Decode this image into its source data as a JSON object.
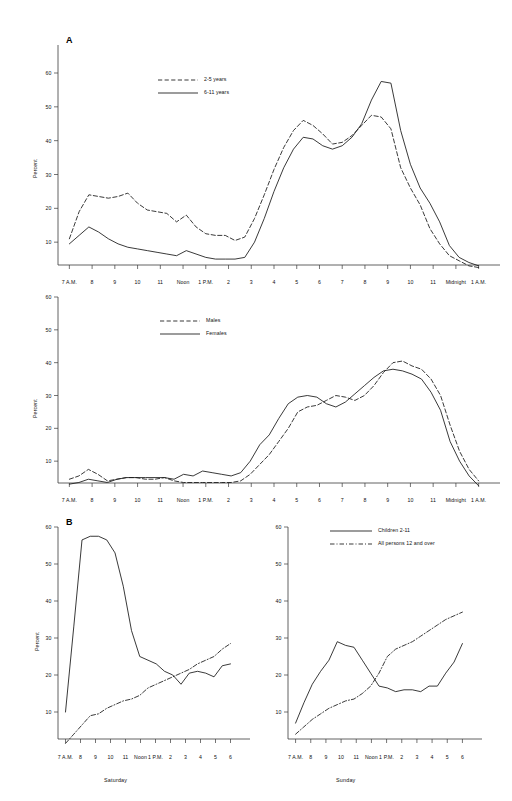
{
  "figure": {
    "panel_a_label": "A",
    "panel_b_label": "B",
    "axis_y_title": "Percent"
  },
  "chart_data": [
    {
      "id": "panel-a-age",
      "type": "line",
      "title": "",
      "panel": "A",
      "xlabel": "",
      "ylabel": "Percent",
      "ylim": [
        0,
        60
      ],
      "yticks": [
        10,
        20,
        30,
        40,
        50,
        60
      ],
      "grid": false,
      "legend_position": "upper-left-inside",
      "x": [
        "7 A.M.",
        "8",
        "9",
        "10",
        "11",
        "Noon",
        "1 P.M.",
        "2",
        "3",
        "4",
        "5",
        "6",
        "7",
        "8",
        "9",
        "10",
        "11",
        "Midnight",
        "1 A.M."
      ],
      "categories": [
        "7 A.M.",
        "8",
        "9",
        "10",
        "11",
        "Noon",
        "1 P.M.",
        "2",
        "3",
        "4",
        "5",
        "6",
        "7",
        "8",
        "9",
        "10",
        "11",
        "Midnight",
        "1 A.M."
      ],
      "series": [
        {
          "name": "2-5 years",
          "style": "dashed",
          "values_half_hourly": [
            11.0,
            19.0,
            24.0,
            23.5,
            23.0,
            23.5,
            24.5,
            21.5,
            19.5,
            19.0,
            18.5,
            16.0,
            18.0,
            14.5,
            12.5,
            12.0,
            12.0,
            10.5,
            11.5,
            17.0,
            24.0,
            31.5,
            38.0,
            43.0,
            46.0,
            44.5,
            42.0,
            39.0,
            39.5,
            41.5,
            44.5,
            47.5,
            47.0,
            43.5,
            32.0,
            26.0,
            21.0,
            14.0,
            9.5,
            6.0,
            4.5,
            3.0,
            2.5
          ],
          "values": [
            11.0,
            24.0,
            23.0,
            19.5,
            18.5,
            12.5,
            12.0,
            10.5,
            17.0,
            31.5,
            46.0,
            39.0,
            41.5,
            47.5,
            43.5,
            21.0,
            9.5,
            4.5,
            2.5
          ]
        },
        {
          "name": "6-11 years",
          "style": "solid",
          "values_half_hourly": [
            9.5,
            12.0,
            14.5,
            13.0,
            11.0,
            9.5,
            8.5,
            8.0,
            7.5,
            7.0,
            6.5,
            6.0,
            7.5,
            6.5,
            5.5,
            5.0,
            5.0,
            5.0,
            5.5,
            10.0,
            17.0,
            25.0,
            32.0,
            37.5,
            41.0,
            40.5,
            38.5,
            37.5,
            38.5,
            41.0,
            45.0,
            52.0,
            57.5,
            57.0,
            43.0,
            33.0,
            26.0,
            21.5,
            16.0,
            9.0,
            5.5,
            4.0,
            3.0
          ],
          "values": [
            9.5,
            14.5,
            11.0,
            8.5,
            7.5,
            6.5,
            7.5,
            5.5,
            5.0,
            10.0,
            25.0,
            41.0,
            38.5,
            41.0,
            57.5,
            43.0,
            26.0,
            9.0,
            3.0
          ]
        }
      ]
    },
    {
      "id": "panel-a-sex",
      "type": "line",
      "title": "",
      "panel": "A",
      "xlabel": "",
      "ylabel": "Percent",
      "ylim": [
        0,
        60
      ],
      "yticks": [
        10,
        20,
        30,
        40,
        50,
        60
      ],
      "grid": false,
      "legend_position": "upper-left-inside",
      "x": [
        "7 A.M.",
        "8",
        "9",
        "10",
        "11",
        "Noon",
        "1 P.M.",
        "2",
        "3",
        "4",
        "5",
        "6",
        "7",
        "8",
        "9",
        "10",
        "11",
        "Midnight",
        "1 A.M."
      ],
      "categories": [
        "7 A.M.",
        "8",
        "9",
        "10",
        "11",
        "Noon",
        "1 P.M.",
        "2",
        "3",
        "4",
        "5",
        "6",
        "7",
        "8",
        "9",
        "10",
        "11",
        "Midnight",
        "1 A.M."
      ],
      "series": [
        {
          "name": "Males",
          "style": "dashed",
          "values_half_hourly": [
            4.5,
            5.5,
            7.5,
            6.0,
            4.0,
            4.5,
            5.0,
            5.0,
            4.5,
            4.5,
            5.0,
            4.0,
            3.5,
            3.5,
            3.5,
            3.5,
            3.5,
            3.5,
            4.0,
            6.0,
            9.0,
            12.0,
            16.0,
            20.0,
            25.0,
            26.5,
            27.0,
            28.5,
            30.0,
            29.5,
            28.5,
            30.0,
            33.0,
            37.0,
            40.0,
            40.5,
            39.0,
            38.0,
            35.0,
            30.0,
            21.0,
            13.0,
            7.5,
            4.0
          ],
          "values": [
            4.5,
            7.5,
            4.0,
            5.0,
            5.0,
            3.5,
            3.5,
            3.5,
            6.0,
            12.0,
            25.0,
            27.0,
            30.0,
            30.0,
            40.0,
            39.0,
            35.0,
            21.0,
            4.0
          ]
        },
        {
          "name": "Females",
          "style": "solid",
          "values_half_hourly": [
            3.0,
            3.5,
            4.5,
            4.0,
            3.5,
            4.5,
            5.0,
            5.0,
            5.0,
            5.0,
            5.0,
            4.5,
            6.0,
            5.5,
            7.0,
            6.5,
            6.0,
            5.5,
            6.5,
            10.0,
            15.0,
            18.0,
            23.0,
            27.5,
            29.5,
            30.0,
            29.5,
            27.5,
            26.5,
            28.0,
            30.5,
            33.0,
            35.5,
            37.5,
            38.0,
            37.5,
            36.5,
            35.0,
            31.0,
            25.5,
            16.0,
            10.0,
            5.5,
            2.5
          ],
          "values": [
            3.0,
            4.5,
            3.5,
            5.0,
            5.0,
            6.0,
            7.0,
            6.0,
            10.0,
            18.0,
            29.5,
            29.5,
            26.5,
            33.0,
            38.0,
            36.5,
            31.0,
            16.0,
            2.5
          ]
        }
      ]
    },
    {
      "id": "panel-b-saturday",
      "type": "line",
      "title": "",
      "panel": "B",
      "xlabel": "Saturday",
      "ylabel": "Percent",
      "ylim": [
        0,
        60
      ],
      "yticks": [
        10,
        20,
        30,
        40,
        50,
        60
      ],
      "grid": false,
      "legend_position": "none",
      "x": [
        "7 A.M.",
        "8",
        "9",
        "10",
        "11",
        "Noon",
        "1 P.M.",
        "2",
        "3",
        "4",
        "5",
        "6"
      ],
      "categories": [
        "7 A.M.",
        "8",
        "9",
        "10",
        "11",
        "Noon",
        "1 P.M.",
        "2",
        "3",
        "4",
        "5",
        "6"
      ],
      "series": [
        {
          "name": "Children 2-11",
          "style": "solid",
          "values_half_hourly": [
            10.0,
            33.0,
            56.5,
            57.5,
            57.5,
            56.5,
            53.0,
            44.0,
            32.0,
            25.0,
            24.0,
            23.0,
            21.0,
            20.0,
            17.5,
            20.5,
            21.0,
            20.5,
            19.5,
            22.5,
            23.0
          ],
          "values": [
            10.0,
            56.5,
            57.5,
            53.0,
            32.0,
            24.0,
            21.0,
            17.5,
            21.0,
            19.5,
            23.0
          ]
        },
        {
          "name": "All persons 12 and over",
          "style": "dashdot",
          "values_half_hourly": [
            1.5,
            4.0,
            6.5,
            9.0,
            9.5,
            11.0,
            12.0,
            13.0,
            13.5,
            14.5,
            16.5,
            17.5,
            18.5,
            19.5,
            20.5,
            21.5,
            23.0,
            24.0,
            25.0,
            27.0,
            28.5
          ],
          "values": [
            1.5,
            6.5,
            9.5,
            12.0,
            13.5,
            16.5,
            18.5,
            20.5,
            23.0,
            25.0,
            28.5
          ]
        }
      ]
    },
    {
      "id": "panel-b-sunday",
      "type": "line",
      "title": "",
      "panel": "B",
      "xlabel": "Sunday",
      "ylabel": "",
      "ylim": [
        0,
        60
      ],
      "yticks": [
        10,
        20,
        30,
        40,
        50,
        60
      ],
      "grid": false,
      "legend_position": "top-center",
      "x": [
        "7 A.M.",
        "8",
        "9",
        "10",
        "11",
        "Noon",
        "1 P.M.",
        "2",
        "3",
        "4",
        "5",
        "6"
      ],
      "categories": [
        "7 A.M.",
        "8",
        "9",
        "10",
        "11",
        "Noon",
        "1 P.M.",
        "2",
        "3",
        "4",
        "5",
        "6"
      ],
      "series": [
        {
          "name": "Children 2-11",
          "style": "solid",
          "values_half_hourly": [
            7.0,
            12.5,
            17.5,
            21.0,
            24.0,
            29.0,
            28.0,
            27.5,
            24.0,
            20.5,
            17.0,
            16.5,
            15.5,
            16.0,
            16.0,
            15.5,
            17.0,
            17.0,
            20.5,
            23.5,
            28.5
          ],
          "values": [
            7.0,
            17.5,
            24.0,
            28.0,
            24.0,
            17.0,
            15.5,
            16.0,
            17.0,
            20.5,
            28.5
          ]
        },
        {
          "name": "All persons 12 and over",
          "style": "dashdot",
          "values_half_hourly": [
            4.0,
            6.0,
            8.0,
            9.5,
            11.0,
            12.0,
            13.0,
            13.5,
            15.0,
            17.0,
            20.5,
            25.0,
            27.0,
            28.0,
            29.0,
            30.5,
            32.0,
            33.5,
            35.0,
            36.0,
            37.0
          ],
          "values": [
            4.0,
            8.0,
            11.0,
            13.0,
            15.0,
            20.5,
            27.0,
            29.0,
            32.0,
            35.0,
            37.0
          ]
        }
      ]
    }
  ]
}
